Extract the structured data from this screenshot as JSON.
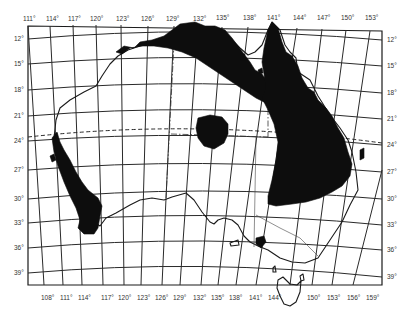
{
  "map": {
    "subject": "Australia",
    "top_longitude_labels": [
      "111°",
      "114°",
      "117°",
      "120°",
      "123°",
      "126°",
      "129°",
      "132°",
      "135°",
      "138°",
      "141°",
      "144°",
      "147°",
      "150°",
      "153°"
    ],
    "bottom_longitude_labels": [
      "108°",
      "111°",
      "114°",
      "117°",
      "120°",
      "123°",
      "126°",
      "129°",
      "132°",
      "135°",
      "138°",
      "141°",
      "144°",
      "150°",
      "153°",
      "156°",
      "159°"
    ],
    "left_latitude_labels": [
      "12°",
      "15°",
      "18°",
      "21°",
      "24°",
      "27°",
      "30°",
      "33°",
      "36°",
      "39°"
    ],
    "right_latitude_labels": [
      "12°",
      "15°",
      "18°",
      "21°",
      "24°",
      "27°",
      "30°",
      "33°",
      "36°",
      "39°"
    ],
    "features": {
      "shaded_regions": [
        "northern-coast-region",
        "queensland-east-region",
        "central-isolated-patch",
        "western-australia-southwest-region",
        "victoria-small-patch"
      ],
      "tropic_line": "Tropic of Capricorn (dashed)",
      "borders": "state borders (dash-dot)"
    },
    "colors": {
      "background": "#ffffff",
      "shading": "#0d0d0d",
      "lines": "#2a2a2a"
    }
  }
}
